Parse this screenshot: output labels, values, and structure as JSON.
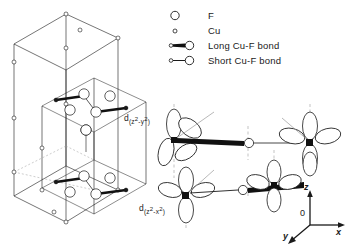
{
  "figure": {
    "background": "#ffffff",
    "ink": "#1a1a1a"
  },
  "legend": {
    "items": [
      {
        "symbol": "large-open-circle",
        "label": "F",
        "radius": 4.2
      },
      {
        "symbol": "small-open-circle",
        "label": "Cu",
        "radius": 2.0
      },
      {
        "symbol": "long-bond-glyph",
        "label": "Long Cu-F bond",
        "radius": 4.2
      },
      {
        "symbol": "short-bond-glyph",
        "label": "Short Cu-F bond",
        "radius": 4.2
      }
    ]
  },
  "orbital_labels": {
    "upper": {
      "prefix": "d",
      "open": "(",
      "term1": "z",
      "exp1": "2",
      "minus": "-",
      "term2": "y",
      "exp2": "2",
      "close": ")",
      "text": "d(z2-y2)"
    },
    "lower": {
      "prefix": "d",
      "open": "(",
      "term1": "z",
      "exp1": "2",
      "minus": "-",
      "term2": "x",
      "exp2": "2",
      "close": ")",
      "text": "d(z2-x2)"
    }
  },
  "axes": {
    "origin_label": "0",
    "z_label": "z",
    "x_label": "x",
    "y_label": "y"
  },
  "unit_cell": {
    "description": "tetragonal unit cell outline with Cu and F sites",
    "atom_counts": {
      "F": 14,
      "Cu": 10
    }
  },
  "colors": {
    "stroke": "#1a1a1a",
    "fill": "#ffffff",
    "dashed": "#8a8a8a",
    "bond_long": "#111111",
    "bond_short": "#111111"
  }
}
